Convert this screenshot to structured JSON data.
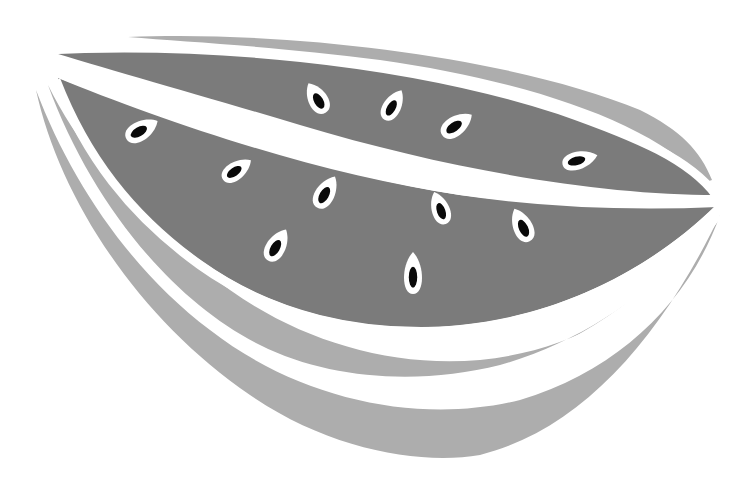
{
  "image": {
    "subject": "Watermelon slice illustration",
    "style": "grayscale flat illustration",
    "colors": {
      "background": "#ffffff",
      "flesh": "#7b7b7b",
      "rind": "#adadad",
      "stripe": "#ffffff",
      "seed_outline": "#ffffff",
      "seed": "#0a0a0a"
    },
    "seed_count": 11,
    "seeds": [
      {
        "x": 317,
        "y": 98,
        "rot": -30,
        "rx": 13,
        "ry": 17
      },
      {
        "x": 393,
        "y": 105,
        "rot": 30,
        "rx": 12,
        "ry": 17
      },
      {
        "x": 457,
        "y": 125,
        "rot": 55,
        "rx": 13,
        "ry": 18
      },
      {
        "x": 580,
        "y": 160,
        "rot": 75,
        "rx": 12,
        "ry": 18
      },
      {
        "x": 142,
        "y": 130,
        "rot": 60,
        "rx": 13,
        "ry": 18
      },
      {
        "x": 237,
        "y": 170,
        "rot": 55,
        "rx": 12,
        "ry": 17
      },
      {
        "x": 326,
        "y": 192,
        "rot": 30,
        "rx": 13,
        "ry": 18
      },
      {
        "x": 440,
        "y": 208,
        "rot": -20,
        "rx": 12,
        "ry": 17
      },
      {
        "x": 522,
        "y": 225,
        "rot": -25,
        "rx": 13,
        "ry": 18
      },
      {
        "x": 277,
        "y": 245,
        "rot": 30,
        "rx": 13,
        "ry": 18
      },
      {
        "x": 413,
        "y": 273,
        "rot": 0,
        "rx": 12,
        "ry": 21
      }
    ]
  }
}
